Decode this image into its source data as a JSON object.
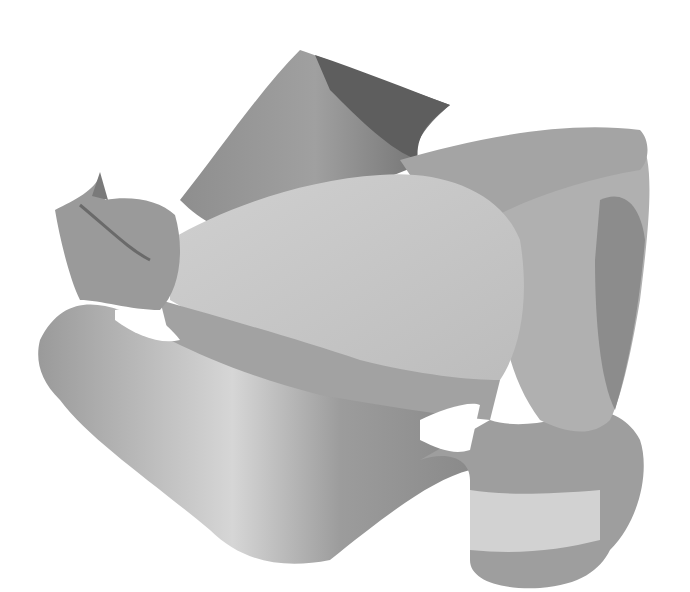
{
  "figure": {
    "background": "#ffffff",
    "palette": {
      "dark": "#5a5a5a",
      "mid": "#8c8c8c",
      "midlight": "#a8a8a8",
      "light": "#c8c8c8",
      "highlight": "#dcdcdc"
    }
  }
}
